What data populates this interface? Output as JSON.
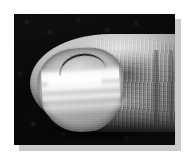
{
  "figure": {
    "kind": "clinical-photograph",
    "color_mode": "grayscale",
    "caption": "",
    "alt_text": "Grayscale close-up photograph of a fingertip showing transverse white bands across the nail plate on a dark background",
    "frame": {
      "page_background": "#ffffff",
      "shadow_color": "#c9c9c9",
      "photo_left": 14,
      "photo_top": 14,
      "photo_width": 161,
      "photo_height": 131
    },
    "palette": {
      "backdrop_black": "#0a0a0a",
      "skin_highlight": "#d8d8d8",
      "skin_midtone": "#a2a2a2",
      "skin_shadow": "#4e4e4e",
      "nail_plate": "#b4b4b4",
      "nail_band_white": "#ffffff",
      "cuticle_line": "#101010"
    },
    "regions": [
      {
        "name": "backdrop",
        "label": "Dark studio backdrop"
      },
      {
        "name": "finger",
        "label": "Finger shaft and distal pulp"
      },
      {
        "name": "skin-texture",
        "label": "Skin striations"
      },
      {
        "name": "knuckle-creases",
        "label": "Knuckle crease arcs"
      },
      {
        "name": "lateral-fold-highlight",
        "label": "Lateral nail fold highlight"
      },
      {
        "name": "pulp-highlight",
        "label": "Pulp specular highlight"
      },
      {
        "name": "nail-plate",
        "label": "Nail plate"
      },
      {
        "name": "nail-bands",
        "label": "Transverse white bands"
      },
      {
        "name": "nail-band-bright",
        "label": "Brightest central white band"
      },
      {
        "name": "nail-lunula",
        "label": "Lunula light patch"
      },
      {
        "name": "cuticle-line",
        "label": "Proximal nail fold crease"
      },
      {
        "name": "under-shadow",
        "label": "Cast shadow under fingertip"
      }
    ]
  }
}
